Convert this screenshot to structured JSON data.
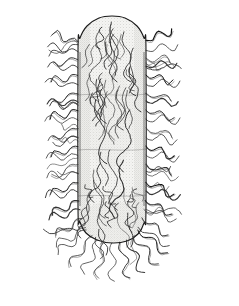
{
  "figure": {
    "title": "Rod-shaped bacterium with peritrichous flagella",
    "caption": "",
    "subject": "bacillus-cell",
    "medium": "pen-and-ink line drawing with stipple shading",
    "background_color": "#ffffff",
    "ink_color": "#1a1a1a",
    "cell_fill_color": "#f2f2f0",
    "stipple_color": "#9a9a96",
    "frame": {
      "color": "#1a1a1a",
      "thickness_px": 2,
      "x": 8,
      "y": 8,
      "width": 220,
      "height": 286
    },
    "cell_body": {
      "shape": "rod-capsule",
      "x_left": 78,
      "x_right": 146,
      "y_top": 16,
      "y_bottom": 242,
      "cap_radius": 34
    },
    "appendages": {
      "name": "flagella",
      "count": 72,
      "extent_left": 44,
      "extent_right": 190,
      "extent_bottom": 284,
      "extent_top": 30
    }
  },
  "chart_data": {
    "type": "scatter",
    "title": "Rod-shaped bacterium with peritrichous flagella",
    "xlabel": "",
    "ylabel": "",
    "grid": false,
    "legend": "none",
    "xlim": [
      0,
      239
    ],
    "ylim": [
      0,
      306
    ],
    "body_outline": [
      [
        78,
        50
      ],
      [
        78,
        208
      ],
      [
        80,
        222
      ],
      [
        86,
        233
      ],
      [
        97,
        240
      ],
      [
        112,
        243
      ],
      [
        127,
        241
      ],
      [
        138,
        234
      ],
      [
        144,
        223
      ],
      [
        146,
        208
      ],
      [
        146,
        50
      ],
      [
        144,
        38
      ],
      [
        137,
        26
      ],
      [
        125,
        18
      ],
      [
        112,
        16
      ],
      [
        99,
        18
      ],
      [
        87,
        26
      ],
      [
        80,
        38
      ]
    ],
    "flagella_left": [
      {
        "x": 78,
        "y": 42,
        "dx": -26,
        "dy": -8,
        "waves": 3
      },
      {
        "x": 78,
        "y": 52,
        "dx": -30,
        "dy": -6,
        "waves": 3
      },
      {
        "x": 78,
        "y": 60,
        "dx": -24,
        "dy": 2,
        "waves": 2
      },
      {
        "x": 78,
        "y": 68,
        "dx": -30,
        "dy": -2,
        "waves": 3
      },
      {
        "x": 78,
        "y": 76,
        "dx": -27,
        "dy": 5,
        "waves": 3
      },
      {
        "x": 78,
        "y": 85,
        "dx": -33,
        "dy": -3,
        "waves": 3
      },
      {
        "x": 78,
        "y": 94,
        "dx": -24,
        "dy": 6,
        "waves": 2
      },
      {
        "x": 78,
        "y": 102,
        "dx": -31,
        "dy": 1,
        "waves": 3
      },
      {
        "x": 78,
        "y": 111,
        "dx": -28,
        "dy": 7,
        "waves": 3
      },
      {
        "x": 78,
        "y": 120,
        "dx": -33,
        "dy": 0,
        "waves": 3
      },
      {
        "x": 78,
        "y": 129,
        "dx": -25,
        "dy": 8,
        "waves": 2
      },
      {
        "x": 78,
        "y": 138,
        "dx": -30,
        "dy": 2,
        "waves": 3
      },
      {
        "x": 78,
        "y": 147,
        "dx": -27,
        "dy": 9,
        "waves": 3
      },
      {
        "x": 78,
        "y": 156,
        "dx": -32,
        "dy": 1,
        "waves": 3
      },
      {
        "x": 78,
        "y": 165,
        "dx": -26,
        "dy": 10,
        "waves": 2
      },
      {
        "x": 78,
        "y": 174,
        "dx": -31,
        "dy": 3,
        "waves": 3
      },
      {
        "x": 78,
        "y": 183,
        "dx": -28,
        "dy": 11,
        "waves": 3
      },
      {
        "x": 78,
        "y": 192,
        "dx": -33,
        "dy": 4,
        "waves": 3
      },
      {
        "x": 79,
        "y": 201,
        "dx": -27,
        "dy": 13,
        "waves": 3
      },
      {
        "x": 80,
        "y": 210,
        "dx": -31,
        "dy": 9,
        "waves": 3
      },
      {
        "x": 82,
        "y": 219,
        "dx": -26,
        "dy": 16,
        "waves": 3
      },
      {
        "x": 86,
        "y": 228,
        "dx": -30,
        "dy": 18,
        "waves": 3
      }
    ],
    "flagella_right": [
      {
        "x": 146,
        "y": 40,
        "dx": 26,
        "dy": -10,
        "waves": 3
      },
      {
        "x": 146,
        "y": 50,
        "dx": 32,
        "dy": -5,
        "waves": 3
      },
      {
        "x": 146,
        "y": 58,
        "dx": 24,
        "dy": 3,
        "waves": 2
      },
      {
        "x": 146,
        "y": 66,
        "dx": 31,
        "dy": -3,
        "waves": 3
      },
      {
        "x": 146,
        "y": 75,
        "dx": 27,
        "dy": 6,
        "waves": 3
      },
      {
        "x": 146,
        "y": 84,
        "dx": 34,
        "dy": -2,
        "waves": 3
      },
      {
        "x": 146,
        "y": 93,
        "dx": 25,
        "dy": 7,
        "waves": 2
      },
      {
        "x": 146,
        "y": 101,
        "dx": 32,
        "dy": 1,
        "waves": 3
      },
      {
        "x": 146,
        "y": 110,
        "dx": 28,
        "dy": 8,
        "waves": 3
      },
      {
        "x": 146,
        "y": 119,
        "dx": 34,
        "dy": 0,
        "waves": 3
      },
      {
        "x": 146,
        "y": 128,
        "dx": 26,
        "dy": 9,
        "waves": 2
      },
      {
        "x": 146,
        "y": 137,
        "dx": 31,
        "dy": 3,
        "waves": 3
      },
      {
        "x": 146,
        "y": 146,
        "dx": 28,
        "dy": 10,
        "waves": 3
      },
      {
        "x": 146,
        "y": 155,
        "dx": 33,
        "dy": 2,
        "waves": 3
      },
      {
        "x": 146,
        "y": 164,
        "dx": 25,
        "dy": 11,
        "waves": 2
      },
      {
        "x": 146,
        "y": 173,
        "dx": 32,
        "dy": 4,
        "waves": 3
      },
      {
        "x": 146,
        "y": 182,
        "dx": 28,
        "dy": 12,
        "waves": 3
      },
      {
        "x": 146,
        "y": 191,
        "dx": 34,
        "dy": 5,
        "waves": 3
      },
      {
        "x": 145,
        "y": 200,
        "dx": 27,
        "dy": 14,
        "waves": 3
      },
      {
        "x": 144,
        "y": 209,
        "dx": 32,
        "dy": 10,
        "waves": 3
      },
      {
        "x": 142,
        "y": 218,
        "dx": 26,
        "dy": 17,
        "waves": 3
      },
      {
        "x": 138,
        "y": 227,
        "dx": 31,
        "dy": 19,
        "waves": 3
      }
    ],
    "flagella_bottom": [
      {
        "x": 92,
        "y": 236,
        "dx": -22,
        "dy": 30,
        "waves": 3
      },
      {
        "x": 98,
        "y": 240,
        "dx": -14,
        "dy": 34,
        "waves": 3
      },
      {
        "x": 104,
        "y": 242,
        "dx": -6,
        "dy": 36,
        "waves": 3
      },
      {
        "x": 112,
        "y": 243,
        "dx": 1,
        "dy": 38,
        "waves": 3
      },
      {
        "x": 120,
        "y": 242,
        "dx": 9,
        "dy": 36,
        "waves": 3
      },
      {
        "x": 127,
        "y": 240,
        "dx": 17,
        "dy": 33,
        "waves": 3
      },
      {
        "x": 133,
        "y": 236,
        "dx": 25,
        "dy": 28,
        "waves": 3
      },
      {
        "x": 86,
        "y": 230,
        "dx": -28,
        "dy": 24,
        "waves": 3
      },
      {
        "x": 138,
        "y": 230,
        "dx": 29,
        "dy": 23,
        "waves": 3
      }
    ],
    "internal_strands": [
      {
        "x": 112,
        "y": 22,
        "dx": 4,
        "dy": 60,
        "waves": 3
      },
      {
        "x": 100,
        "y": 30,
        "dx": -6,
        "dy": 55,
        "waves": 3
      },
      {
        "x": 124,
        "y": 32,
        "dx": 6,
        "dy": 50,
        "waves": 3
      },
      {
        "x": 106,
        "y": 80,
        "dx": 8,
        "dy": 60,
        "waves": 3
      },
      {
        "x": 120,
        "y": 86,
        "dx": -6,
        "dy": 58,
        "waves": 3
      },
      {
        "x": 96,
        "y": 100,
        "dx": 10,
        "dy": 64,
        "waves": 3
      },
      {
        "x": 130,
        "y": 110,
        "dx": -8,
        "dy": 62,
        "waves": 3
      },
      {
        "x": 110,
        "y": 150,
        "dx": 6,
        "dy": 60,
        "waves": 3
      },
      {
        "x": 124,
        "y": 160,
        "dx": -10,
        "dy": 58,
        "waves": 3
      },
      {
        "x": 94,
        "y": 170,
        "dx": 12,
        "dy": 56,
        "waves": 3
      }
    ]
  }
}
